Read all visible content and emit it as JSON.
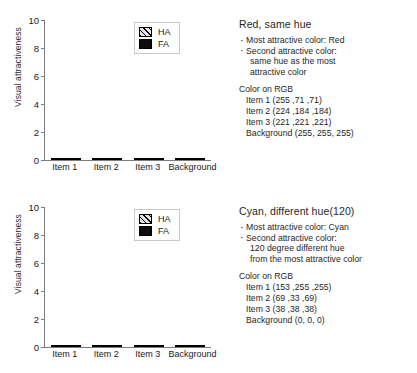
{
  "figure": {
    "panels": [
      {
        "id": "top",
        "chart": {
          "ylabel": "Visual attractiveness",
          "yticks": [
            "10",
            "8",
            "6",
            "4",
            "2",
            "0"
          ],
          "categories": [
            "Item 1",
            "Item 2",
            "Item 3",
            "Background"
          ],
          "legend": [
            {
              "key": "HA",
              "label": "HA"
            },
            {
              "key": "FA",
              "label": "FA"
            }
          ]
        },
        "text": {
          "title": "Red, same hue",
          "bullets": [
            {
              "main": "Most attractive color: Red",
              "cont": []
            },
            {
              "main": "Second attractive color:",
              "cont": [
                "same hue as the most",
                "attractive color"
              ]
            }
          ],
          "rgb_heading": "Color on RGB",
          "rgb_lines": [
            "Item 1 (255 ,71 ,71)",
            "Item 2 (224 ,184 ,184)",
            "Item 3 (221 ,221 ,221)",
            "Background (255, 255, 255)"
          ]
        }
      },
      {
        "id": "bottom",
        "chart": {
          "ylabel": "Visual attractiveness",
          "yticks": [
            "10",
            "8",
            "6",
            "4",
            "2",
            "0"
          ],
          "categories": [
            "Item 1",
            "Item 2",
            "Item 3",
            "Background"
          ],
          "legend": [
            {
              "key": "HA",
              "label": "HA"
            },
            {
              "key": "FA",
              "label": "FA"
            }
          ]
        },
        "text": {
          "title": "Cyan, different hue(120)",
          "bullets": [
            {
              "main": "Most attractive color: Cyan",
              "cont": []
            },
            {
              "main": "Second attractive color:",
              "cont": [
                "120 degree different hue",
                "from the most attractive color"
              ]
            }
          ],
          "rgb_heading": "Color on RGB",
          "rgb_lines": [
            "Item 1 (153 ,255 ,255)",
            "Item 2 (69 ,33 ,69)",
            "Item 3 (38 ,38 ,38)",
            "Background (0, 0, 0)"
          ]
        }
      }
    ]
  },
  "chart_data": [
    {
      "type": "bar",
      "stacked": true,
      "title": "Red, same hue",
      "xlabel": "",
      "ylabel": "Visual attractiveness",
      "ylim": [
        0,
        10
      ],
      "yticks": [
        0,
        2,
        4,
        6,
        8,
        10
      ],
      "grid": false,
      "legend_position": "top-right",
      "categories": [
        "Item 1",
        "Item 2",
        "Item 3",
        "Background"
      ],
      "series": [
        {
          "name": "FA",
          "values": [
            2.45,
            1.3,
            0.65,
            0.3
          ]
        },
        {
          "name": "HA",
          "values": [
            5.55,
            0.7,
            0.15,
            0.2
          ]
        }
      ],
      "totals": [
        8.0,
        2.0,
        0.8,
        0.5
      ]
    },
    {
      "type": "bar",
      "stacked": true,
      "title": "Cyan, different hue(120)",
      "xlabel": "",
      "ylabel": "Visual attractiveness",
      "ylim": [
        0,
        10
      ],
      "yticks": [
        0,
        2,
        4,
        6,
        8,
        10
      ],
      "grid": false,
      "legend_position": "top-right",
      "categories": [
        "Item 1",
        "Item 2",
        "Item 3",
        "Background"
      ],
      "series": [
        {
          "name": "FA",
          "values": [
            2.4,
            0.9,
            0.75,
            0.1
          ]
        },
        {
          "name": "HA",
          "values": [
            5.3,
            1.05,
            0.0,
            0.45
          ]
        }
      ],
      "totals": [
        7.7,
        1.95,
        0.75,
        0.55
      ]
    }
  ]
}
